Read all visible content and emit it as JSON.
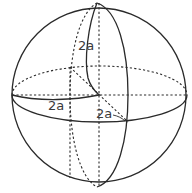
{
  "diagram": {
    "type": "sphere-with-axes",
    "labels": {
      "vertical_radius": "2a",
      "horizontal_radius": "2a",
      "depth_radius": "2a"
    },
    "colors": {
      "stroke": "#2a2a2a",
      "background": "#ffffff",
      "label": "#3a3a3a"
    }
  }
}
